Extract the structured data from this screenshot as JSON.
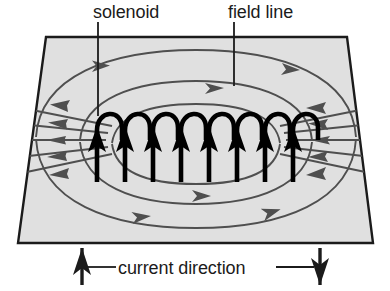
{
  "figure": {
    "width": 390,
    "height": 291,
    "background_color": "#ffffff"
  },
  "labels": {
    "solenoid": "solenoid",
    "field_line": "field line",
    "current_direction": "current direction"
  },
  "colors": {
    "plane_fill": "#e0e0e0",
    "plane_stroke": "#1b1b1b",
    "field_line_stroke": "#4f4f4f",
    "coil_stroke": "#000000",
    "text": "#1b1b1b",
    "leader_stroke": "#1b1b1b"
  },
  "plane": {
    "description": "horizontal plane shown in perspective as a trapezoid",
    "corners": [
      [
        46,
        37
      ],
      [
        347,
        37
      ],
      [
        373,
        243
      ],
      [
        18,
        243
      ]
    ]
  },
  "solenoid": {
    "turn_count": 8,
    "first_turn_x": 97,
    "turn_spacing": 28,
    "arrow_direction": "up",
    "description": "eight coil turns drawn as hooks with upward current arrows"
  },
  "field_lines": {
    "upper_ellipse_count": 2,
    "lower_ellipse_count": 2,
    "side_line_count": 5,
    "upper_arrow_direction": "right",
    "lower_arrow_direction": "right",
    "left_arrow_direction": "left",
    "right_arrow_direction": "left",
    "description": "closed loops circulating around the solenoid axis"
  },
  "current_direction": {
    "left_arrow": "up",
    "left_arrow_x": 82,
    "right_arrow": "down",
    "right_arrow_x": 320,
    "baseline_y": 248
  },
  "leaders": [
    {
      "name": "solenoid-leader",
      "x": 98,
      "y1": 22,
      "y2": 116
    },
    {
      "name": "field-line-leader",
      "x": 234,
      "y1": 22,
      "y2": 86
    }
  ]
}
